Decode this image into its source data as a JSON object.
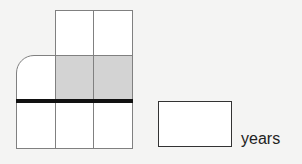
{
  "diagram": {
    "grid": {
      "columns": 3,
      "rows": 3,
      "shaded_cells": [
        [
          1,
          1
        ],
        [
          1,
          2
        ]
      ],
      "missing_cells": [
        [
          0,
          0
        ]
      ],
      "rounded_cell": [
        1,
        0
      ],
      "thick_line_below_row": 1,
      "colors": {
        "border": "#808080",
        "shade": "#d3d3d3",
        "fill": "#ffffff",
        "thick_line": "#111111"
      }
    },
    "answer": {
      "value": "",
      "unit": "years"
    }
  }
}
